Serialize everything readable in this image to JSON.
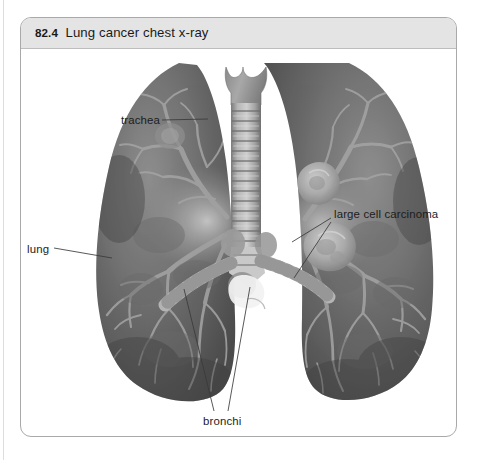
{
  "figure": {
    "number": "82.4",
    "title": "Lung cancer chest x-ray",
    "caption_full": "82.4  Lung cancer chest x-ray"
  },
  "annotations": [
    {
      "id": "trachea",
      "label": "trachea",
      "side": "left"
    },
    {
      "id": "lung",
      "label": "lung",
      "side": "left"
    },
    {
      "id": "carcinoma",
      "label": "large cell carcinoma",
      "side": "right"
    },
    {
      "id": "bronchi",
      "label": "bronchi",
      "side": "bottom"
    }
  ],
  "colors": {
    "frame_border": "#a9a9a9",
    "title_bar": "#e4e4e4",
    "page_background": "#ffffff",
    "label_text": "#1c1c1c",
    "leader_line": "#3a3a3a",
    "lung_dark": "#5e5e5e",
    "lung_mid": "#7a7a7a",
    "bronchial_tree": "#9e9e9e",
    "trachea": "#8d8d8d",
    "tumor": "#bdbdbd"
  },
  "image": {
    "kind": "grayscale-radiograph-illustration",
    "subject": "anterior view of human lungs, trachea, bronchial tree with two large cell carcinoma masses in the right lung field"
  }
}
